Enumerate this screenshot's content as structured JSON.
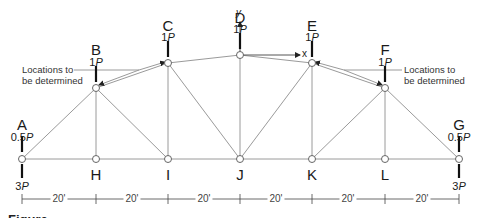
{
  "diagram": {
    "type": "truss",
    "nodes": [
      {
        "id": "A",
        "label": "A",
        "x": 22,
        "y": 159,
        "load_top": "0.5",
        "load_bottom": "3"
      },
      {
        "id": "B",
        "label": "B",
        "x": 96,
        "y": 88,
        "load_top": "1"
      },
      {
        "id": "C",
        "label": "C",
        "x": 168,
        "y": 63,
        "load_top": "1"
      },
      {
        "id": "D",
        "label": "D",
        "x": 240,
        "y": 55,
        "load_top": "1"
      },
      {
        "id": "E",
        "label": "E",
        "x": 312,
        "y": 63,
        "load_top": "1"
      },
      {
        "id": "F",
        "label": "F",
        "x": 385,
        "y": 88,
        "load_top": "1"
      },
      {
        "id": "G",
        "label": "G",
        "x": 459,
        "y": 159,
        "load_top": "0.5",
        "load_bottom": "3"
      },
      {
        "id": "H",
        "label": "H",
        "x": 96,
        "y": 159
      },
      {
        "id": "I",
        "label": "I",
        "x": 168,
        "y": 159
      },
      {
        "id": "J",
        "label": "J",
        "x": 240,
        "y": 159
      },
      {
        "id": "K",
        "label": "K",
        "x": 312,
        "y": 159
      },
      {
        "id": "L",
        "label": "L",
        "x": 385,
        "y": 159
      }
    ],
    "load_unit": "P",
    "axes": {
      "x_label": "x",
      "y_label": "y"
    },
    "annotations": {
      "left_note_line1": "Locations to",
      "left_note_line2": "be determined",
      "right_note_line1": "Locations to",
      "right_note_line2": "be determined"
    },
    "dimensions": [
      "20'",
      "20'",
      "20'",
      "20'",
      "20'",
      "20'"
    ],
    "caption": "Figure"
  },
  "labels": {
    "A": "A",
    "B": "B",
    "C": "C",
    "D": "D",
    "E": "E",
    "F": "F",
    "G": "G",
    "H": "H",
    "I": "I",
    "J": "J",
    "K": "K",
    "L": "L",
    "load_A_top": "0.5",
    "load_A_bot": "3",
    "load_B": "1",
    "load_C": "1",
    "load_D": "1",
    "load_E": "1",
    "load_F": "1",
    "load_G_top": "0.5",
    "load_G_bot": "3",
    "P": "P"
  }
}
